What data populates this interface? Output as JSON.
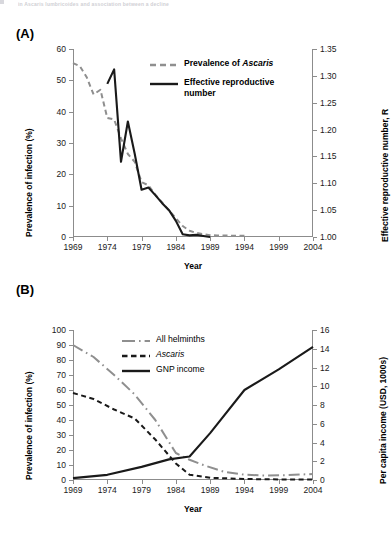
{
  "running_head": "in Ascaris lumbricoides and association between a decline",
  "figure": {
    "panels": [
      {
        "letter": "(A)"
      },
      {
        "letter": "(B)"
      }
    ]
  },
  "panelA": {
    "letter": "(A)",
    "legend": [
      {
        "key": "dashed-gray-line",
        "label_prefix": "Prevalence of ",
        "label_italic": "Ascaris",
        "label_suffix": ""
      },
      {
        "key": "solid-black-line",
        "label_prefix": "Effective reproductive",
        "label_italic": "",
        "label_suffix": "number"
      }
    ]
  },
  "panelB": {
    "letter": "(B)",
    "legend": [
      {
        "key": "dashdot-gray-line",
        "label_prefix": "All helminths",
        "label_italic": "",
        "label_suffix": ""
      },
      {
        "key": "dashed-black-line",
        "label_prefix": "",
        "label_italic": "Ascaris",
        "label_suffix": ""
      },
      {
        "key": "solid-black-line",
        "label_prefix": "GNP income",
        "label_italic": "",
        "label_suffix": ""
      }
    ]
  },
  "colors": {
    "gray_series": "#8f8f8f",
    "black_series": "#1a1a1a",
    "axis": "#8c8c8c",
    "text": "#000000"
  },
  "chart_data": [
    {
      "id": "panel-a",
      "type": "line",
      "title": "(A)",
      "xlabel": "Year",
      "ylabel": "Prevalence of infection (%)",
      "y2label": "Effective reproductive number, R",
      "xlim": [
        1969,
        2004
      ],
      "ylim": [
        0,
        60
      ],
      "y2lim": [
        1.0,
        1.35
      ],
      "xticks": [
        1969,
        1974,
        1979,
        1984,
        1989,
        1994,
        1999,
        2004
      ],
      "yticks": [
        0,
        10,
        20,
        30,
        40,
        50,
        60
      ],
      "y2ticks": [
        "1.00",
        "1.05",
        "1.10",
        "1.15",
        "1.20",
        "1.25",
        "1.30",
        "1.35"
      ],
      "grid": false,
      "legend_position": "upper-center",
      "series": [
        {
          "name": "Prevalence of Ascaris",
          "style": "dashed",
          "color": "#8f8f8f",
          "axis": "left",
          "x": [
            1969,
            1970,
            1971,
            1972,
            1973,
            1974,
            1975,
            1976,
            1977,
            1978,
            1979,
            1980,
            1981,
            1982,
            1983,
            1984,
            1985,
            1986,
            1987,
            1988,
            1989,
            1990,
            1991,
            1992,
            1993,
            1994
          ],
          "values": [
            55.5,
            54.5,
            51.0,
            45.5,
            47.0,
            38.0,
            37.5,
            31.5,
            26.5,
            24.0,
            17.5,
            16.5,
            13.5,
            11.0,
            8.5,
            6.0,
            3.5,
            2.0,
            1.3,
            0.9,
            0.6,
            0.5,
            0.5,
            0.4,
            0.4,
            0.4
          ]
        },
        {
          "name": "Effective reproductive number",
          "style": "solid",
          "color": "#1a1a1a",
          "axis": "right",
          "x": [
            1974,
            1975,
            1976,
            1977,
            1978,
            1979,
            1980,
            1981,
            1982,
            1983,
            1984,
            1985,
            1986,
            1987,
            1988,
            1989
          ],
          "values": [
            1.285,
            1.312,
            1.14,
            1.215,
            1.155,
            1.088,
            1.092,
            1.078,
            1.063,
            1.05,
            1.03,
            1.005,
            1.003,
            1.004,
            1.002,
            1.0
          ]
        }
      ]
    },
    {
      "id": "panel-b",
      "type": "line",
      "title": "(B)",
      "xlabel": "Year",
      "ylabel": "Prevalence of infection (%)",
      "y2label": "Per capita income (USD, 1000s)",
      "xlim": [
        1969,
        2004
      ],
      "ylim": [
        0,
        100
      ],
      "y2lim": [
        0,
        16
      ],
      "xticks": [
        1969,
        1974,
        1979,
        1984,
        1989,
        1994,
        1999,
        2004
      ],
      "yticks": [
        0,
        10,
        20,
        30,
        40,
        50,
        60,
        70,
        80,
        90,
        100
      ],
      "y2ticks": [
        0,
        2,
        4,
        6,
        8,
        10,
        12,
        14,
        16
      ],
      "grid": false,
      "legend_position": "upper-center",
      "series": [
        {
          "name": "All helminths",
          "style": "dash-dot",
          "color": "#8f8f8f",
          "axis": "left",
          "x": [
            1969,
            1972,
            1975,
            1978,
            1981,
            1984,
            1986,
            1988,
            1991,
            1994,
            1997,
            2000,
            2004
          ],
          "values": [
            90.0,
            82.0,
            70.0,
            57.0,
            40.0,
            18.0,
            13.5,
            10.0,
            5.5,
            3.5,
            3.0,
            3.2,
            4.0
          ]
        },
        {
          "name": "Ascaris",
          "style": "dashed",
          "color": "#1a1a1a",
          "axis": "left",
          "x": [
            1969,
            1972,
            1975,
            1978,
            1981,
            1984,
            1986,
            1989,
            1992,
            1995,
            1999,
            2004
          ],
          "values": [
            58.0,
            54.0,
            47.0,
            41.0,
            27.0,
            11.0,
            3.5,
            1.5,
            1.0,
            0.6,
            0.4,
            0.3
          ]
        },
        {
          "name": "GNP income",
          "style": "solid",
          "color": "#1a1a1a",
          "axis": "right",
          "x": [
            1969,
            1974,
            1979,
            1983,
            1986,
            1989,
            1994,
            1999,
            2004
          ],
          "values": [
            0.2,
            0.55,
            1.4,
            2.2,
            2.5,
            5.0,
            9.6,
            11.8,
            14.2
          ]
        }
      ]
    }
  ]
}
